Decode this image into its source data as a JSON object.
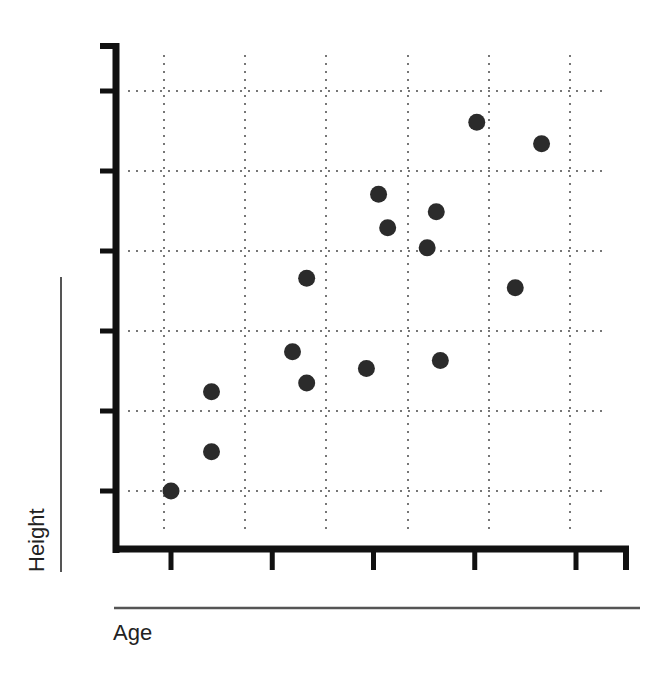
{
  "chart_data": {
    "type": "scatter",
    "title": "",
    "xlabel": "Age",
    "ylabel": "Height",
    "x_tick_labels": [
      "",
      "",
      "",
      "",
      ""
    ],
    "y_tick_labels": [
      "",
      "",
      "",
      "",
      "",
      ""
    ],
    "x_ticks": [
      1,
      2,
      3,
      4,
      5
    ],
    "y_ticks": [
      1,
      2,
      3,
      4,
      5,
      6
    ],
    "xlim": [
      0.5,
      5.5
    ],
    "ylim": [
      -0.2,
      6.6
    ],
    "grid": true,
    "grid_style": "dotted",
    "legend": null,
    "series": [
      {
        "name": "points",
        "color": "#2b2b2b",
        "points": [
          {
            "x": 1.0,
            "y": 1.0
          },
          {
            "x": 1.4,
            "y": 1.49
          },
          {
            "x": 1.4,
            "y": 2.24
          },
          {
            "x": 2.2,
            "y": 2.74
          },
          {
            "x": 2.34,
            "y": 2.35
          },
          {
            "x": 2.34,
            "y": 3.66
          },
          {
            "x": 2.93,
            "y": 2.53
          },
          {
            "x": 3.05,
            "y": 4.71
          },
          {
            "x": 3.14,
            "y": 4.29
          },
          {
            "x": 3.53,
            "y": 4.04
          },
          {
            "x": 3.62,
            "y": 4.49
          },
          {
            "x": 3.66,
            "y": 2.63
          },
          {
            "x": 4.02,
            "y": 5.61
          },
          {
            "x": 4.4,
            "y": 3.54
          },
          {
            "x": 4.66,
            "y": 5.34
          }
        ]
      }
    ]
  },
  "colors": {
    "axis": "#111111",
    "grid": "#777777",
    "point": "#2b2b2b",
    "label_rule": "#555555"
  }
}
